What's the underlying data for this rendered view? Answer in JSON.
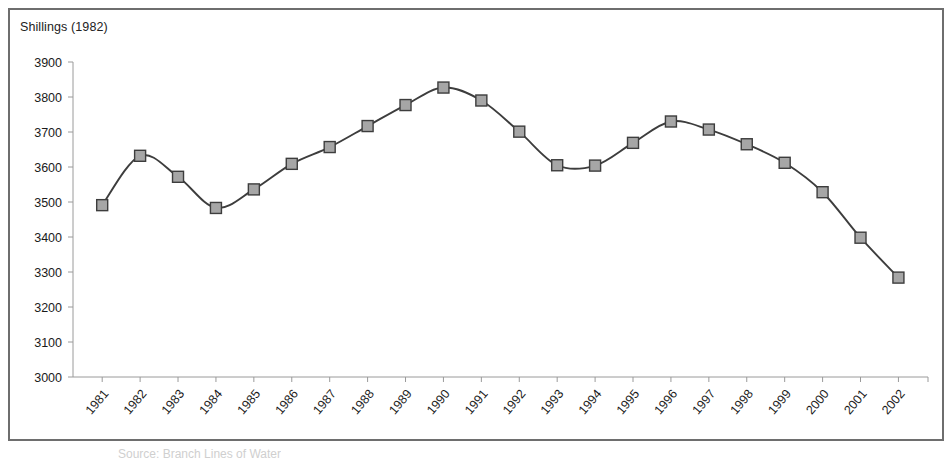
{
  "figure": {
    "border_color": "#6e6e6e",
    "background": "#ffffff"
  },
  "caption": {
    "text": "Source: Branch Lines of Water"
  },
  "chart_data": {
    "type": "line",
    "title": "",
    "axis_title": "Shillings (1982)",
    "xlabel": "",
    "ylabel": "Shillings (1982)",
    "ylim": [
      3000,
      3900
    ],
    "ytick_step": 100,
    "yticks": [
      "3000",
      "3100",
      "3200",
      "3300",
      "3400",
      "3500",
      "3600",
      "3700",
      "3800",
      "3900"
    ],
    "grid": false,
    "legend": "none",
    "marker": "square",
    "marker_fill": "#a6a6a6",
    "marker_edge": "#3d3d3d",
    "line_color": "#3d3d3d",
    "categories": [
      "1981",
      "1982",
      "1983",
      "1984",
      "1985",
      "1986",
      "1987",
      "1988",
      "1989",
      "1990",
      "1991",
      "1992",
      "1993",
      "1994",
      "1995",
      "1996",
      "1997",
      "1998",
      "1999",
      "2000",
      "2001",
      "2002"
    ],
    "values": [
      3491,
      3632,
      3572,
      3483,
      3536,
      3609,
      3657,
      3717,
      3777,
      3827,
      3790,
      3701,
      3605,
      3604,
      3669,
      3730,
      3707,
      3665,
      3612,
      3528,
      3398,
      3284
    ]
  }
}
